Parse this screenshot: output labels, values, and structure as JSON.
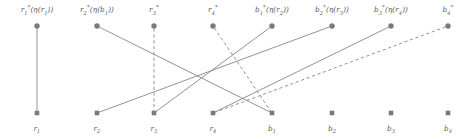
{
  "figure": {
    "type": "bipartite-graph",
    "width": 471,
    "height": 139,
    "background": "#ffffff",
    "node_color": "#7a7a7a",
    "edge_color": "#808080",
    "label_color": "#5a5a5a",
    "top_row_y": 26,
    "bottom_row_y": 113,
    "top_marker": "circle",
    "bottom_marker": "square"
  },
  "top_nodes": [
    {
      "id": "r1s",
      "x": 37,
      "label_html": "r<sub>1</sub><sup>*</sup>(<span class=\"gk\">&#951;</span>(r<sub>1</sub>))",
      "label_text": "r1*(η(r1))"
    },
    {
      "id": "r2s",
      "x": 97,
      "label_html": "r<sub>2</sub><sup>*</sup>(<span class=\"gk\">&#951;</span>(b<sub>1</sub>))",
      "label_text": "r2*(η(b1))"
    },
    {
      "id": "r3s",
      "x": 154,
      "label_html": "r<sub>3</sub><sup>*</sup>",
      "label_text": "r3*"
    },
    {
      "id": "r4s",
      "x": 213,
      "label_html": "r<sub>4</sub><sup>*</sup>",
      "label_text": "r4*"
    },
    {
      "id": "b1s",
      "x": 272,
      "label_html": "b<sub>1</sub><sup>*</sup>(<span class=\"gk\">&#951;</span>(r<sub>2</sub>))",
      "label_text": "b1*(η(r2))"
    },
    {
      "id": "b2s",
      "x": 332,
      "label_html": "b<sub>2</sub><sup>*</sup>(<span class=\"gk\">&#951;</span>(r<sub>3</sub>))",
      "label_text": "b2*(η(r3))"
    },
    {
      "id": "b3s",
      "x": 391,
      "label_html": "b<sub>3</sub><sup>*</sup>(<span class=\"gk\">&#951;</span>(r<sub>4</sub>))",
      "label_text": "b3*(η(r4))"
    },
    {
      "id": "b4s",
      "x": 448,
      "label_html": "b<sub>4</sub><sup>*</sup>",
      "label_text": "b4*"
    }
  ],
  "bottom_nodes": [
    {
      "id": "r1",
      "x": 37,
      "label_html": "r<sub>1</sub>",
      "label_text": "r1"
    },
    {
      "id": "r2",
      "x": 97,
      "label_html": "r<sub>2</sub>",
      "label_text": "r2"
    },
    {
      "id": "r3",
      "x": 154,
      "label_html": "r<sub>3</sub>",
      "label_text": "r3"
    },
    {
      "id": "r4",
      "x": 213,
      "label_html": "r<sub>4</sub>",
      "label_text": "r4"
    },
    {
      "id": "b1",
      "x": 272,
      "label_html": "b<sub>1</sub>",
      "label_text": "b1"
    },
    {
      "id": "b2",
      "x": 332,
      "label_html": "b<sub>2</sub>",
      "label_text": "b2"
    },
    {
      "id": "b3",
      "x": 391,
      "label_html": "b<sub>3</sub>",
      "label_text": "b3"
    },
    {
      "id": "b4",
      "x": 448,
      "label_html": "b<sub>4</sub>",
      "label_text": "b4"
    }
  ],
  "edges": [
    {
      "from": "r1s",
      "to": "r1",
      "x1": 37,
      "x2": 37,
      "style": "solid"
    },
    {
      "from": "r2s",
      "to": "b1",
      "x1": 97,
      "x2": 272,
      "style": "solid"
    },
    {
      "from": "r3s",
      "to": "r3",
      "x1": 154,
      "x2": 154,
      "style": "dashed"
    },
    {
      "from": "r4s",
      "to": "b1",
      "x1": 213,
      "x2": 272,
      "style": "dashed"
    },
    {
      "from": "b1s",
      "to": "r3",
      "x1": 272,
      "x2": 154,
      "style": "solid"
    },
    {
      "from": "b2s",
      "to": "r2",
      "x1": 332,
      "x2": 97,
      "style": "solid"
    },
    {
      "from": "b3s",
      "to": "r4",
      "x1": 391,
      "x2": 213,
      "style": "solid"
    },
    {
      "from": "b4s",
      "to": "r4",
      "x1": 448,
      "x2": 213,
      "style": "dashed"
    }
  ]
}
